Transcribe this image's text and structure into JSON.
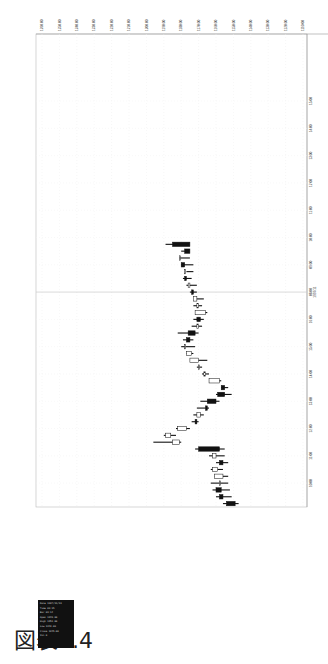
{
  "title": "図表3.4",
  "legend": {
    "lines": [
      "Date 1997/11/19",
      "Time 09:15",
      "Bar 09:14",
      "Open 1249.00",
      "High 1251.00",
      "Low 1243.00",
      "Close 1245.00",
      "Vol 0"
    ]
  },
  "chart_data": {
    "type": "candlestick",
    "title": "図表3.4",
    "orientation": "rotated: price on horizontal axis (decreasing left to right), time on vertical axis (later times at top)",
    "xlabel": "",
    "ylabel": "",
    "price_ticks": [
      "1260.00",
      "1250.00",
      "1240.00",
      "1230.00",
      "1220.00",
      "1210.00",
      "1200.00",
      "1190.00",
      "1180.00",
      "1170.00",
      "1160.00",
      "1150.00",
      "1140.00",
      "1130.00",
      "1120.00",
      "1110.00"
    ],
    "price_range": [
      1110,
      1260
    ],
    "time_ticks": [
      {
        "label": "10:00",
        "slot": 3
      },
      {
        "label": "11:00",
        "slot": 7
      },
      {
        "label": "12:00",
        "slot": 11
      },
      {
        "label": "13:00",
        "slot": 15
      },
      {
        "label": "14:00",
        "slot": 19
      },
      {
        "label": "15:00",
        "slot": 23
      },
      {
        "label": "16:00",
        "slot": 27
      },
      {
        "label": "08:00",
        "sublabel": "1997/11",
        "slot": 31,
        "day_divider": true
      },
      {
        "label": "09:00",
        "slot": 35
      },
      {
        "label": "10:00",
        "slot": 39
      },
      {
        "label": "11:00",
        "slot": 43
      },
      {
        "label": "12:00",
        "slot": 47
      },
      {
        "label": "13:00",
        "slot": 51
      },
      {
        "label": "14:00",
        "slot": 55
      },
      {
        "label": "15:00",
        "slot": 59
      }
    ],
    "slots_total": 62,
    "grid": true,
    "candles": [
      {
        "o": 1154,
        "h": 1156,
        "l": 1147,
        "c": 1149
      },
      {
        "o": 1158,
        "h": 1160,
        "l": 1151,
        "c": 1156
      },
      {
        "o": 1160,
        "h": 1162,
        "l": 1152,
        "c": 1157
      },
      {
        "o": 1158,
        "h": 1163,
        "l": 1153,
        "c": 1158
      },
      {
        "o": 1156,
        "h": 1161,
        "l": 1153,
        "c": 1161
      },
      {
        "o": 1159,
        "h": 1163,
        "l": 1156,
        "c": 1162
      },
      {
        "o": 1158,
        "h": 1160,
        "l": 1153,
        "c": 1156
      },
      {
        "o": 1160,
        "h": 1164,
        "l": 1155,
        "c": 1162
      },
      {
        "o": 1170,
        "h": 1172,
        "l": 1155,
        "c": 1158
      },
      {
        "o": 1181,
        "h": 1196,
        "l": 1180,
        "c": 1185
      },
      {
        "o": 1186,
        "h": 1190,
        "l": 1183,
        "c": 1189
      },
      {
        "o": 1177,
        "h": 1183,
        "l": 1175,
        "c": 1182
      },
      {
        "o": 1172,
        "h": 1174,
        "l": 1170,
        "c": 1171
      },
      {
        "o": 1169,
        "h": 1173,
        "l": 1167,
        "c": 1171
      },
      {
        "o": 1166,
        "h": 1171,
        "l": 1164,
        "c": 1165
      },
      {
        "o": 1165,
        "h": 1169,
        "l": 1158,
        "c": 1160
      },
      {
        "o": 1159,
        "h": 1160,
        "l": 1151,
        "c": 1155
      },
      {
        "o": 1157,
        "h": 1157,
        "l": 1153,
        "c": 1155
      },
      {
        "o": 1158,
        "h": 1163,
        "l": 1157,
        "c": 1164
      },
      {
        "o": 1166,
        "h": 1168,
        "l": 1164,
        "c": 1167
      },
      {
        "o": 1170,
        "h": 1171,
        "l": 1168,
        "c": 1170
      },
      {
        "o": 1170,
        "h": 1172,
        "l": 1165,
        "c": 1175
      },
      {
        "o": 1174,
        "h": 1177,
        "l": 1173,
        "c": 1177
      },
      {
        "o": 1178,
        "h": 1180,
        "l": 1172,
        "c": 1178
      },
      {
        "o": 1177,
        "h": 1179,
        "l": 1173,
        "c": 1175
      },
      {
        "o": 1176,
        "h": 1182,
        "l": 1170,
        "c": 1172
      },
      {
        "o": 1170,
        "h": 1174,
        "l": 1168,
        "c": 1171
      },
      {
        "o": 1171,
        "h": 1173,
        "l": 1167,
        "c": 1169
      },
      {
        "o": 1166,
        "h": 1171,
        "l": 1165,
        "c": 1172
      },
      {
        "o": 1170,
        "h": 1173,
        "l": 1168,
        "c": 1171
      },
      {
        "o": 1171,
        "h": 1172,
        "l": 1167,
        "c": 1173
      },
      {
        "o": 1174,
        "h": 1175,
        "l": 1171,
        "c": 1173
      },
      {
        "o": 1175,
        "h": 1177,
        "l": 1171,
        "c": 1176
      },
      {
        "o": 1178,
        "h": 1179,
        "l": 1174,
        "c": 1177
      },
      {
        "o": 1178,
        "h": 1177,
        "l": 1173,
        "c": 1178
      },
      {
        "o": 1180,
        "h": 1180,
        "l": 1173,
        "c": 1178
      },
      {
        "o": 1181,
        "h": 1181,
        "l": 1175,
        "c": 1181
      },
      {
        "o": 1178,
        "h": 1180,
        "l": 1176,
        "c": 1175
      },
      {
        "o": 1185,
        "h": 1189,
        "l": 1183,
        "c": 1175
      }
    ],
    "candles_note": "approximate OHLC readings; remainder listed in series below",
    "series": [
      {
        "name": "day1",
        "note": "Prior session, 09:00–16:00 (bottom half of figure)"
      },
      {
        "name": "day2",
        "note": "1997/11 session starting 08:00, sharp gap up then decline (top half)"
      }
    ]
  },
  "footer_note": "© Omega"
}
